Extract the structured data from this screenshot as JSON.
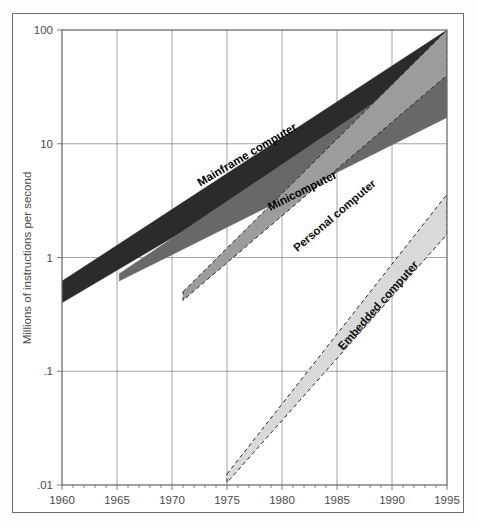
{
  "chart_data": {
    "type": "area",
    "title": "",
    "subtitle": "",
    "xlabel": "",
    "ylabel": "Millions of instructions per second",
    "yscale": "log",
    "ylim": [
      0.01,
      100
    ],
    "xlim": [
      1960,
      1995
    ],
    "grid": true,
    "legend_position": "inline-labels",
    "x_ticks": [
      "1960",
      "1965",
      "1970",
      "1975",
      "1980",
      "1985",
      "1990",
      "1995"
    ],
    "x_tick_values": [
      1960,
      1965,
      1970,
      1975,
      1980,
      1985,
      1990,
      1995
    ],
    "x_minor_tick_interval": 1,
    "y_ticks": [
      "100",
      "10",
      "1",
      ".1",
      ".01"
    ],
    "y_tick_values": [
      100,
      10,
      1,
      0.1,
      0.01
    ],
    "series": [
      {
        "name": "Mainframe computer",
        "label": "Mainframe computer",
        "color": "#2b2b2b",
        "border": "solid",
        "start_year": 1960,
        "end_year": 1995,
        "lower": [
          {
            "x": 1960,
            "y": 0.4
          },
          {
            "x": 1995,
            "y": 40
          }
        ],
        "upper": [
          {
            "x": 1960,
            "y": 0.62
          },
          {
            "x": 1995,
            "y": 100
          }
        ],
        "label_x": 1977,
        "label_y": 7.5
      },
      {
        "name": "Minicomputer",
        "label": "Minicomputer",
        "color": "#686868",
        "border": "solid",
        "start_year": 1965,
        "end_year": 1995,
        "lower": [
          {
            "x": 1965.2,
            "y": 0.62
          },
          {
            "x": 1995,
            "y": 17
          }
        ],
        "upper": [
          {
            "x": 1965.2,
            "y": 0.72
          },
          {
            "x": 1995,
            "y": 62
          }
        ],
        "label_x": 1982,
        "label_y": 3.6
      },
      {
        "name": "Personal computer",
        "label": "Personal computer",
        "color": "#9c9c9c",
        "border": "dashed",
        "start_year": 1971,
        "end_year": 1995,
        "lower": [
          {
            "x": 1971,
            "y": 0.42
          },
          {
            "x": 1995,
            "y": 40
          }
        ],
        "upper": [
          {
            "x": 1971,
            "y": 0.5
          },
          {
            "x": 1995,
            "y": 100
          }
        ],
        "label_x": 1985,
        "label_y": 2.2
      },
      {
        "name": "Embedded computer",
        "label": "Embedded computer",
        "color": "#d9d9d9",
        "border": "dashed",
        "start_year": 1975,
        "end_year": 1995,
        "lower": [
          {
            "x": 1975,
            "y": 0.0105
          },
          {
            "x": 1995,
            "y": 1.6
          }
        ],
        "upper": [
          {
            "x": 1975,
            "y": 0.0125
          },
          {
            "x": 1995,
            "y": 3.6
          }
        ],
        "label_x": 1989,
        "label_y": 0.36
      }
    ]
  },
  "axes": {
    "y_title": "Millions of instructions per second"
  }
}
